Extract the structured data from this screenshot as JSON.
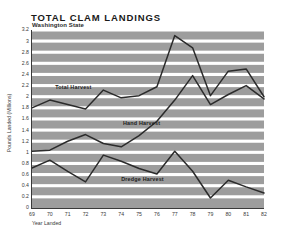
{
  "chart_data": {
    "type": "line",
    "title": "TOTAL  CLAM  LANDINGS",
    "subtitle": "Washington State",
    "xlabel": "Year Landed",
    "ylabel": "Pounds Landed (Millions)",
    "xlim": [
      69,
      82
    ],
    "ylim": [
      0,
      3.2
    ],
    "grid": true,
    "grid_style": "horizontal white bands on gray plot background",
    "legend": "inline series labels",
    "categories": [
      "69",
      "70",
      "71",
      "72",
      "73",
      "74",
      "75",
      "76",
      "77",
      "78",
      "79",
      "80",
      "81",
      "82"
    ],
    "ytick_labels": [
      "0",
      "0.2",
      "0.4",
      "0.6",
      "0.8",
      "1",
      "1.2",
      "1.4",
      "1.6",
      "1.8",
      "2",
      "2.2",
      "2.4",
      "2.6",
      "2.8",
      "3",
      "3.2"
    ],
    "ytick_values": [
      0,
      0.2,
      0.4,
      0.6,
      0.8,
      1,
      1.2,
      1.4,
      1.6,
      1.8,
      2,
      2.2,
      2.4,
      2.6,
      2.8,
      3,
      3.2
    ],
    "series": [
      {
        "name": "Total Harvest",
        "label_x": 70.3,
        "label_y": 2.17,
        "values": [
          1.8,
          1.94,
          1.86,
          1.78,
          2.12,
          1.98,
          2.02,
          2.18,
          3.1,
          2.88,
          2.02,
          2.46,
          2.5,
          2.0
        ]
      },
      {
        "name": "Hand Harvest",
        "label_x": 74.1,
        "label_y": 1.53,
        "values": [
          1.02,
          1.04,
          1.2,
          1.32,
          1.16,
          1.1,
          1.3,
          1.56,
          1.94,
          2.38,
          1.86,
          2.04,
          2.2,
          1.96
        ]
      },
      {
        "name": "Dredge Harvest",
        "label_x": 74.0,
        "label_y": 0.52,
        "values": [
          0.72,
          0.86,
          0.66,
          0.47,
          0.95,
          0.84,
          0.71,
          0.61,
          1.02,
          0.66,
          0.18,
          0.5,
          0.38,
          0.27
        ]
      }
    ]
  },
  "colors": {
    "plot_background": "#9d9d9d",
    "gridline": "#ffffff",
    "line": "#2b2b2b",
    "axis": "#3a3a3a",
    "page_background": "#ffffff"
  }
}
